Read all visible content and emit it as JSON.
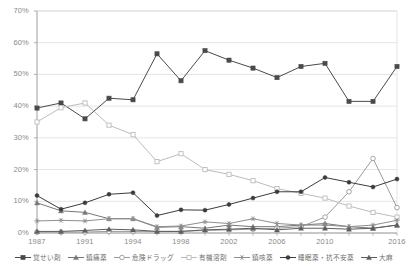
{
  "chart_data": {
    "type": "line",
    "title": "",
    "xlabel": "",
    "ylabel": "",
    "ylim": [
      0,
      70
    ],
    "ytick_labels": [
      "0%",
      "10%",
      "20%",
      "30%",
      "40%",
      "50%",
      "60%",
      "70%"
    ],
    "ytick_values": [
      0,
      10,
      20,
      30,
      40,
      50,
      60,
      70
    ],
    "grid": true,
    "legend_position": "bottom",
    "x": [
      1987,
      1989,
      1991,
      1992,
      1994,
      1996,
      1998,
      2000,
      2002,
      2004,
      2006,
      2008,
      2010,
      2012,
      2014,
      2016
    ],
    "xtick_labels": [
      "1987",
      "1991",
      "1994",
      "1998",
      "2002",
      "2006",
      "2010",
      "2016"
    ],
    "xtick_values": [
      1987,
      1991,
      1994,
      1998,
      2002,
      2006,
      2010,
      2016
    ],
    "series": [
      {
        "name": "覚せい剤",
        "marker": "filled-square",
        "color": "#4a4a4a",
        "values": [
          39.4,
          41.0,
          36.0,
          42.5,
          42.0,
          56.5,
          48.0,
          57.5,
          54.5,
          52.0,
          49.0,
          52.5,
          53.5,
          41.5,
          41.5,
          52.5
        ]
      },
      {
        "name": "鎮痛薬",
        "marker": "filled-triangle",
        "color": "#777777",
        "values": [
          9.5,
          7.0,
          6.5,
          4.5,
          4.5,
          1.8,
          2.0,
          1.5,
          2.5,
          2.0,
          2.0,
          2.5,
          3.0,
          2.0,
          1.5,
          2.5
        ]
      },
      {
        "name": "危険ドラッグ",
        "marker": "open-circle",
        "color": "#9b9b9b",
        "values": [
          0.3,
          0.3,
          0.3,
          0.5,
          0.5,
          0.5,
          0.5,
          0.8,
          1.0,
          1.2,
          1.5,
          2.0,
          5.0,
          13.0,
          23.5,
          8.0
        ]
      },
      {
        "name": "有機溶剤",
        "marker": "open-square",
        "color": "#bcbcbc",
        "values": [
          35.0,
          39.5,
          41.0,
          34.0,
          31.0,
          22.5,
          25.0,
          20.0,
          18.5,
          16.5,
          14.0,
          12.5,
          11.0,
          8.5,
          6.5,
          5.0
        ]
      },
      {
        "name": "鎮咳薬",
        "marker": "star",
        "color": "#8f8f8f",
        "values": [
          3.8,
          4.0,
          3.8,
          4.5,
          4.5,
          2.0,
          2.2,
          3.5,
          3.0,
          4.5,
          3.0,
          2.5,
          2.5,
          2.0,
          2.5,
          4.0
        ]
      },
      {
        "name": "睡眠薬・抗不安薬",
        "marker": "filled-circle",
        "color": "#3c3c3c",
        "values": [
          11.8,
          7.5,
          9.5,
          12.2,
          12.7,
          5.5,
          7.3,
          7.2,
          9.0,
          11.0,
          13.0,
          13.0,
          17.5,
          16.0,
          14.5,
          17.0
        ]
      },
      {
        "name": "大麻",
        "marker": "filled-triangle",
        "color": "#5e5e5e",
        "values": [
          0.5,
          0.5,
          0.8,
          1.2,
          1.0,
          0.5,
          0.5,
          1.0,
          1.2,
          1.5,
          1.0,
          1.5,
          1.5,
          1.2,
          1.5,
          2.5
        ]
      }
    ]
  },
  "legend": {
    "items": [
      {
        "label": "覚せい剤"
      },
      {
        "label": "鎮痛薬"
      },
      {
        "label": "危険ドラッグ"
      },
      {
        "label": "有機溶剤"
      },
      {
        "label": "鎮咳薬"
      },
      {
        "label": "睡眠薬・抗不安薬"
      },
      {
        "label": "大麻"
      }
    ]
  }
}
